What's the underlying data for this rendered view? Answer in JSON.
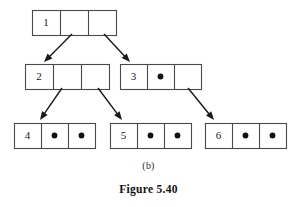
{
  "figure": {
    "subcaption": "(b)",
    "caption": "Figure 5.40",
    "colors": {
      "stroke": "#4a4a4a",
      "arrow": "#1a1a1a",
      "dot": "#111111",
      "background": "#ffffff",
      "text": "#111111"
    }
  },
  "chart_data": {
    "type": "diagram",
    "title": "Figure 5.40",
    "subtitle": "(b)",
    "nodes": [
      {
        "id": "node-1",
        "key": "1",
        "level": 0,
        "x": 32,
        "y": 10,
        "w": 84,
        "h": 25,
        "cells": [
          "1",
          "",
          ""
        ],
        "cell_kinds": [
          "key",
          "pointer-link",
          "pointer-link"
        ]
      },
      {
        "id": "node-2",
        "key": "2",
        "level": 1,
        "x": 25,
        "y": 64,
        "w": 84,
        "h": 25,
        "cells": [
          "2",
          "",
          ""
        ],
        "cell_kinds": [
          "key",
          "pointer-link",
          "pointer-link"
        ]
      },
      {
        "id": "node-3",
        "key": "3",
        "level": 1,
        "x": 120,
        "y": 64,
        "w": 81,
        "h": 25,
        "cells": [
          "3",
          "●",
          ""
        ],
        "cell_kinds": [
          "key",
          "pointer-null",
          "pointer-link"
        ]
      },
      {
        "id": "node-4",
        "key": "4",
        "level": 2,
        "x": 14,
        "y": 123,
        "w": 81,
        "h": 25,
        "cells": [
          "4",
          "●",
          "●"
        ],
        "cell_kinds": [
          "key",
          "pointer-null",
          "pointer-null"
        ]
      },
      {
        "id": "node-5",
        "key": "5",
        "level": 2,
        "x": 110,
        "y": 123,
        "w": 81,
        "h": 25,
        "cells": [
          "5",
          "●",
          "●"
        ],
        "cell_kinds": [
          "key",
          "pointer-null",
          "pointer-null"
        ]
      },
      {
        "id": "node-6",
        "key": "6",
        "level": 2,
        "x": 205,
        "y": 123,
        "w": 81,
        "h": 25,
        "cells": [
          "6",
          "●",
          "●"
        ],
        "cell_kinds": [
          "key",
          "pointer-null",
          "pointer-null"
        ]
      }
    ],
    "edges": [
      {
        "id": "edge-1-2",
        "from": "node-1",
        "from_cell": 1,
        "to": "node-2",
        "x1": 72,
        "y1": 34,
        "x2": 44,
        "y2": 62
      },
      {
        "id": "edge-1-3",
        "from": "node-1",
        "from_cell": 2,
        "to": "node-3",
        "x1": 104,
        "y1": 34,
        "x2": 130,
        "y2": 62
      },
      {
        "id": "edge-2-4",
        "from": "node-2",
        "from_cell": 1,
        "to": "node-4",
        "x1": 62,
        "y1": 88,
        "x2": 40,
        "y2": 120
      },
      {
        "id": "edge-2-5",
        "from": "node-2",
        "from_cell": 2,
        "to": "node-5",
        "x1": 98,
        "y1": 88,
        "x2": 122,
        "y2": 120
      },
      {
        "id": "edge-3-6",
        "from": "node-3",
        "from_cell": 2,
        "to": "node-6",
        "x1": 188,
        "y1": 88,
        "x2": 214,
        "y2": 120
      }
    ]
  }
}
